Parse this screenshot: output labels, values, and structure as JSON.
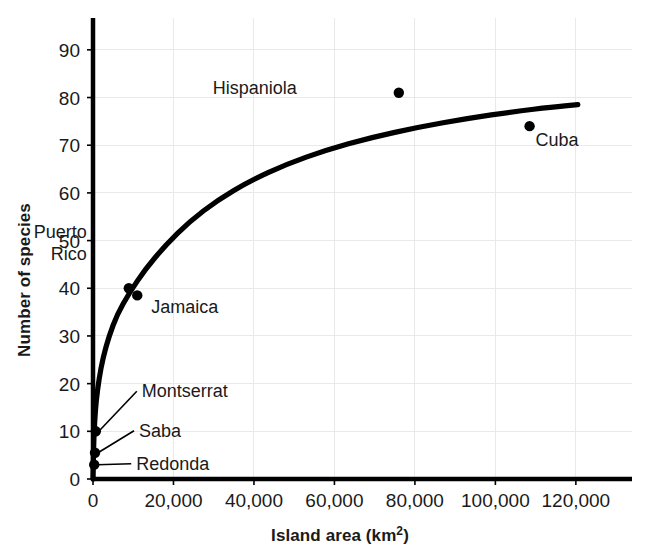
{
  "chart_data": {
    "type": "scatter",
    "title": "",
    "xlabel": "Island area (km2)",
    "xlabel_base": "Island area (km",
    "xlabel_sup": "2",
    "xlabel_close": ")",
    "ylabel": "Number of species",
    "xlim": [
      0,
      126000
    ],
    "ylim": [
      0,
      95
    ],
    "grid": true,
    "legend": "none",
    "xticks": [
      0,
      20000,
      40000,
      60000,
      80000,
      100000,
      120000
    ],
    "xtick_labels": [
      "0",
      "20,000",
      "40,000",
      "60,000",
      "80,000",
      "100,000",
      "120,000"
    ],
    "yticks": [
      0,
      10,
      20,
      30,
      40,
      50,
      60,
      70,
      80,
      90
    ],
    "ytick_labels": [
      "0",
      "10",
      "20",
      "30",
      "40",
      "50",
      "60",
      "70",
      "80",
      "90"
    ],
    "points": [
      {
        "name": "Redonda",
        "x": 300,
        "y": 3,
        "label_dx": 42,
        "label_dy": 5,
        "leader": true
      },
      {
        "name": "Saba",
        "x": 500,
        "y": 5.5,
        "label_dx": 44,
        "label_dy": -16,
        "leader": true
      },
      {
        "name": "Montserrat",
        "x": 700,
        "y": 10,
        "label_dx": 46,
        "label_dy": -34,
        "leader": true
      },
      {
        "name": "Puerto Rico",
        "x": 8900,
        "y": 40,
        "label_dx": -42,
        "label_dy": -50,
        "leader": false
      },
      {
        "name": "Jamaica",
        "x": 11000,
        "y": 38.5,
        "label_dx": 14,
        "label_dy": 18,
        "leader": false
      },
      {
        "name": "Hispaniola",
        "x": 76000,
        "y": 81,
        "label_dx": -102,
        "label_dy": 1,
        "leader": false
      },
      {
        "name": "Cuba",
        "x": 108500,
        "y": 74,
        "label_dx": 6,
        "label_dy": 20,
        "leader": false
      }
    ],
    "curve_description": "Saturating species-area curve rising steeply from the origin and leveling near 78.5 species at 120,000 km2",
    "curve_asymptote": 78.5,
    "curve_points": [
      {
        "x": 0,
        "y": 0
      },
      {
        "x": 150,
        "y": 7
      },
      {
        "x": 400,
        "y": 12
      },
      {
        "x": 800,
        "y": 16.5
      },
      {
        "x": 1500,
        "y": 21
      },
      {
        "x": 2500,
        "y": 25.5
      },
      {
        "x": 4000,
        "y": 30
      },
      {
        "x": 6000,
        "y": 34.5
      },
      {
        "x": 9000,
        "y": 39
      },
      {
        "x": 13000,
        "y": 44
      },
      {
        "x": 18000,
        "y": 49
      },
      {
        "x": 24000,
        "y": 54
      },
      {
        "x": 31000,
        "y": 58.5
      },
      {
        "x": 39000,
        "y": 62.5
      },
      {
        "x": 48000,
        "y": 66
      },
      {
        "x": 58000,
        "y": 69
      },
      {
        "x": 69000,
        "y": 71.6
      },
      {
        "x": 81000,
        "y": 73.8
      },
      {
        "x": 93000,
        "y": 75.6
      },
      {
        "x": 105000,
        "y": 77.1
      },
      {
        "x": 114000,
        "y": 78
      },
      {
        "x": 120500,
        "y": 78.5
      }
    ],
    "colors": {
      "axis": "#000000",
      "grid": "#e9e9e9",
      "curve": "#000000",
      "point": "#000000",
      "text": "#1a1a1a",
      "background": "#ffffff"
    }
  }
}
